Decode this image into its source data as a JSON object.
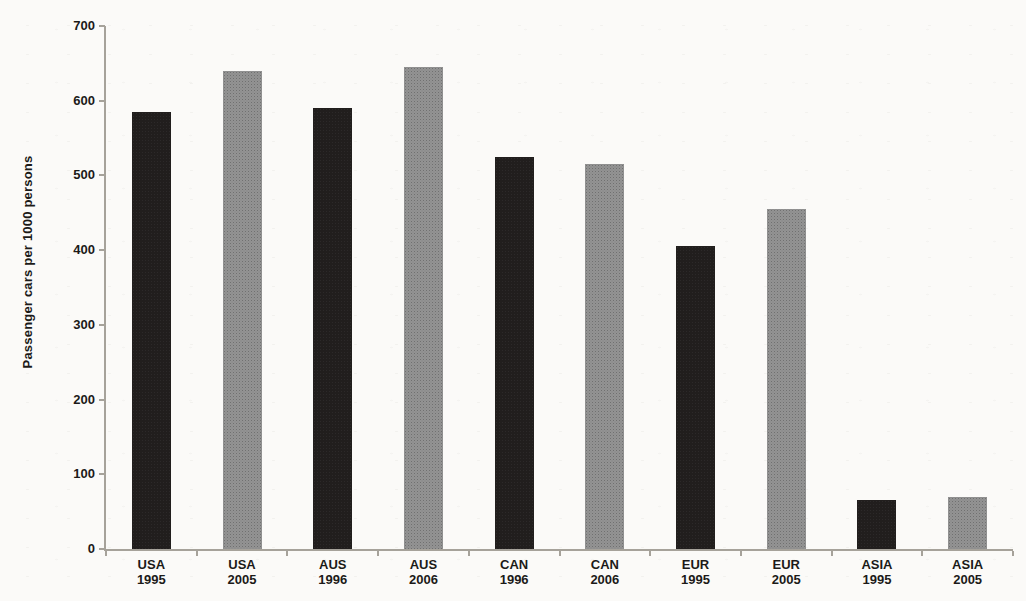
{
  "chart_data": {
    "type": "bar",
    "title": "",
    "ylabel": "Passenger cars per 1000 persons",
    "xlabel": "",
    "ylim": [
      0,
      700
    ],
    "yticks": [
      0,
      100,
      200,
      300,
      400,
      500,
      600,
      700
    ],
    "grid": false,
    "legend": false,
    "categories": [
      "USA 1995",
      "USA 2005",
      "AUS 1996",
      "AUS 2006",
      "CAN 1996",
      "CAN 2006",
      "EUR 1995",
      "EUR 2005",
      "ASIA 1995",
      "ASIA 2005"
    ],
    "values": [
      585,
      640,
      590,
      645,
      525,
      515,
      405,
      455,
      65,
      70
    ],
    "bar_shades": [
      "dark",
      "light",
      "dark",
      "light",
      "dark",
      "light",
      "dark",
      "light",
      "dark",
      "light"
    ],
    "shade_colors": {
      "dark": "#211e1d",
      "light": "#8f8f8f"
    },
    "axis_color": "#a6a29a",
    "text_color": "#1c1a18",
    "background_color": "#fbfaf8"
  }
}
